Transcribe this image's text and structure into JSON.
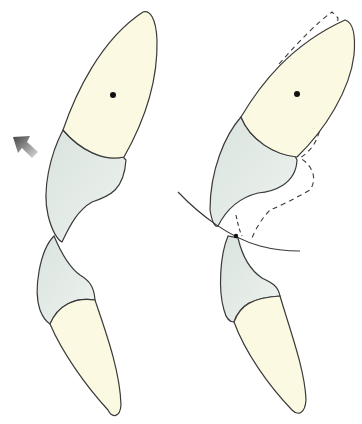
{
  "diagram": {
    "panels": [
      {
        "id": "left",
        "label": "",
        "elements": [
          "upper-incisor",
          "lower-incisor",
          "direction-arrow"
        ]
      },
      {
        "id": "right",
        "label": "",
        "elements": [
          "upper-incisor",
          "lower-incisor",
          "dashed-original-outline",
          "arc-curve",
          "contact-point"
        ]
      }
    ],
    "colors": {
      "crown": "#fbf9e2",
      "root": "#e3ebe6",
      "outline": "#3a3a3a",
      "arrow": "#555555",
      "background": "#ffffff"
    }
  }
}
